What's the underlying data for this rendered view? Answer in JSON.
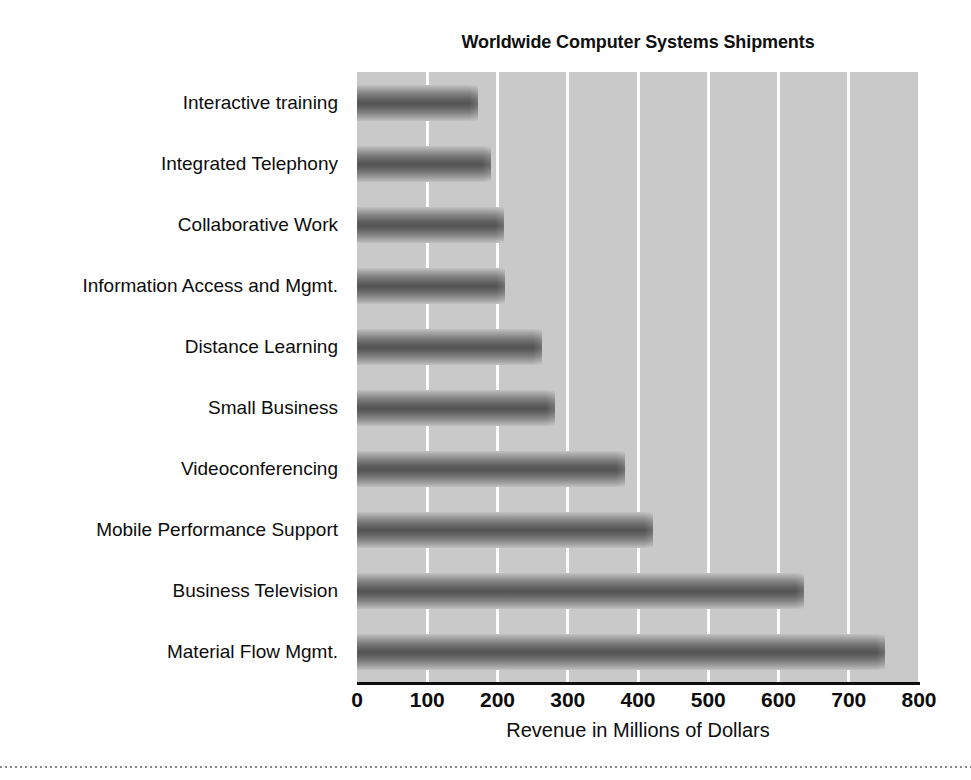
{
  "chart_data": {
    "type": "bar",
    "orientation": "horizontal",
    "title": "Worldwide Computer Systems Shipments",
    "xlabel": "Revenue in Millions of Dollars",
    "ylabel": "",
    "xlim": [
      0,
      800
    ],
    "xticks": [
      "0",
      "100",
      "200",
      "300",
      "400",
      "500",
      "600",
      "700",
      "800"
    ],
    "xtick_values": [
      0,
      100,
      200,
      300,
      400,
      500,
      600,
      700,
      800
    ],
    "grid": "vertical",
    "legend": "none",
    "categories": [
      "Interactive training",
      "Integrated Telephony",
      "Collaborative Work",
      "Information Access and Mgmt.",
      "Distance Learning",
      "Small Business",
      "Videoconferencing",
      "Mobile Performance Support",
      "Business Television",
      "Material Flow Mgmt."
    ],
    "values": [
      172,
      191,
      209,
      211,
      263,
      282,
      381,
      422,
      637,
      751
    ],
    "colors": {
      "plot_background": "#c9c9c9",
      "gridline": "#fbfbfb",
      "bar_dark": "#545454",
      "bar_light": "#c2c2c2",
      "axis": "#0e0e0e",
      "text": "#0d0d0d",
      "figure_background": "#ffffff"
    }
  }
}
